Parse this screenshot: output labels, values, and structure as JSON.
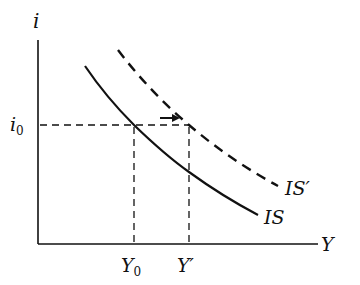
{
  "diagram": {
    "type": "IS curve shift",
    "axes": {
      "y_label": "i",
      "x_label": "Y"
    },
    "levels": {
      "interest_rate": {
        "label": "i",
        "subscript": "0"
      },
      "output_initial": {
        "label": "Y",
        "subscript": "0"
      },
      "output_new": {
        "label": "Y′"
      }
    },
    "curves": [
      {
        "name": "IS",
        "label": "IS",
        "style": "solid"
      },
      {
        "name": "IS_shifted",
        "label": "IS′",
        "style": "dashed"
      }
    ],
    "arrow": {
      "direction": "right",
      "meaning": "rightward shift of IS"
    },
    "colors": {
      "ink": "#111111",
      "background": "#ffffff"
    }
  }
}
